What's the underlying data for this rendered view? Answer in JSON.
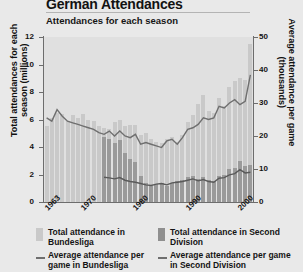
{
  "header": {
    "title": "German Attendances",
    "subtitle": "Attendances for each season"
  },
  "axes": {
    "left_label": "Total attendances for each season (millions)",
    "right_label": "Average attendance per game (thousands)",
    "left_ticks": [
      "0",
      "2",
      "4",
      "6",
      "8",
      "10",
      "12"
    ],
    "right_ticks": [
      "0",
      "10",
      "20",
      "30",
      "40",
      "50"
    ],
    "x_ticks": [
      "1963",
      "1970",
      "1980",
      "1990",
      "2000"
    ]
  },
  "legend": {
    "items": [
      {
        "key": "bundesliga-total",
        "swatch": "bar-light",
        "label": "Total attendance in Bundesliga"
      },
      {
        "key": "second-division-total",
        "swatch": "bar-dark",
        "label": "Total attendance in Second Division"
      },
      {
        "key": "bundesliga-average",
        "swatch": "line",
        "label": "Average attendance per game in Bundesliga"
      },
      {
        "key": "second-division-average",
        "swatch": "line",
        "label": "Average attendance per game in Second Division"
      }
    ]
  },
  "colors": {
    "background": "#e9e9e9",
    "plot_background": "#e0e0e0",
    "bar_bundesliga": "#c9c9c9",
    "bar_second_division": "#9a9a9a",
    "line_bundesliga": "#6f6f6f",
    "line_second_division": "#5a5a5a",
    "axis": "#6d6d6d"
  },
  "chart_data": {
    "type": "bar",
    "title": "German Attendances",
    "subtitle": "Attendances for each season",
    "xlabel": "",
    "ylabel": "Total attendances for each season (millions)",
    "y2label": "Average attendance per game (thousands)",
    "ylim": [
      0,
      12
    ],
    "y2lim": [
      0,
      50
    ],
    "grid": false,
    "legend_position": "bottom",
    "categories": [
      "1963",
      "1964",
      "1965",
      "1966",
      "1967",
      "1968",
      "1969",
      "1970",
      "1971",
      "1972",
      "1973",
      "1974",
      "1975",
      "1976",
      "1977",
      "1978",
      "1979",
      "1980",
      "1981",
      "1982",
      "1983",
      "1984",
      "1985",
      "1986",
      "1987",
      "1988",
      "1989",
      "1990",
      "1991",
      "1992",
      "1993",
      "1994",
      "1995",
      "1996",
      "1997",
      "1998",
      "1999",
      "2000",
      "2001",
      "2002"
    ],
    "series": [
      {
        "name": "Total attendance in Bundesliga",
        "axis": "left",
        "unit": "millions",
        "render": "bar",
        "values": [
          5.5,
          6.1,
          6.5,
          6.4,
          5.9,
          6.3,
          6.1,
          6.4,
          6.0,
          5.9,
          5.5,
          5.4,
          5.3,
          5.8,
          6.0,
          5.5,
          5.6,
          5.6,
          4.9,
          5.0,
          4.6,
          4.4,
          4.3,
          4.6,
          4.7,
          4.4,
          4.9,
          5.8,
          6.3,
          7.1,
          7.8,
          6.6,
          6.5,
          7.6,
          7.0,
          8.4,
          8.8,
          9.0,
          8.9,
          11.5
        ]
      },
      {
        "name": "Total attendance in Second Division",
        "axis": "left",
        "unit": "millions",
        "render": "bar",
        "values": [
          0,
          0,
          0,
          0,
          0,
          0,
          0,
          0,
          0,
          0,
          0,
          4.7,
          4.6,
          4.3,
          4.5,
          3.6,
          3.1,
          2.9,
          1.9,
          1.4,
          1.2,
          1.3,
          1.4,
          1.2,
          1.4,
          1.5,
          1.6,
          1.8,
          1.9,
          1.7,
          1.8,
          1.6,
          1.5,
          1.9,
          2.0,
          2.4,
          2.5,
          3.0,
          2.6,
          2.7
        ]
      },
      {
        "name": "Average attendance per game in Bundesliga",
        "axis": "right",
        "unit": "thousands",
        "render": "line",
        "values": [
          25.5,
          24.5,
          28.0,
          26.0,
          24.5,
          24.0,
          23.5,
          23.0,
          22.5,
          22.0,
          21.0,
          20.5,
          21.5,
          20.0,
          21.5,
          20.0,
          19.5,
          20.5,
          17.5,
          18.0,
          17.5,
          17.0,
          16.5,
          18.5,
          19.0,
          17.5,
          19.5,
          22.0,
          22.5,
          23.5,
          25.5,
          25.0,
          25.5,
          29.0,
          28.5,
          30.0,
          31.0,
          29.5,
          30.5,
          38.5
        ]
      },
      {
        "name": "Average attendance per game in Second Division",
        "axis": "right",
        "unit": "thousands",
        "render": "line",
        "values": [
          null,
          null,
          null,
          null,
          null,
          null,
          null,
          null,
          null,
          null,
          null,
          7.5,
          7.3,
          7.0,
          7.4,
          6.6,
          6.2,
          6.0,
          5.6,
          5.2,
          5.0,
          5.4,
          5.6,
          5.2,
          5.8,
          6.0,
          6.2,
          6.6,
          7.0,
          6.4,
          6.8,
          6.2,
          6.0,
          7.2,
          7.4,
          8.2,
          8.6,
          9.8,
          8.8,
          9.0
        ]
      }
    ]
  }
}
